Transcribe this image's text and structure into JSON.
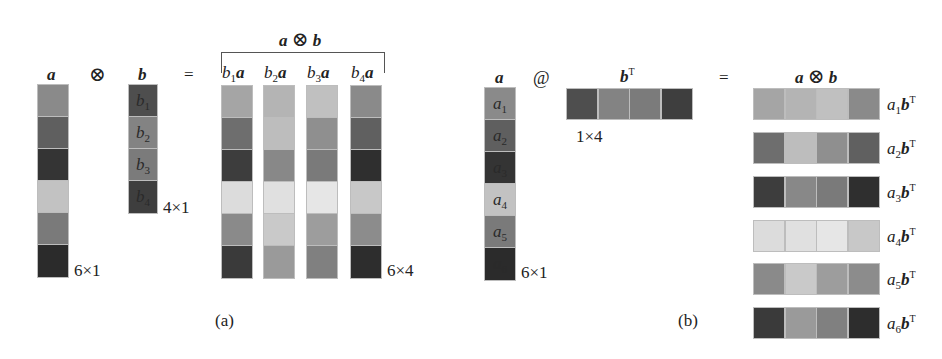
{
  "panel_a": {
    "caption": "(a)",
    "vector_a": {
      "label": "a",
      "shape": "6×1",
      "cells": [
        "#8a8a8a",
        "#5f5f5f",
        "#343434",
        "#c2c2c2",
        "#7a7a7a",
        "#2b2b2b"
      ]
    },
    "operator": "⊗",
    "vector_b": {
      "label": "b",
      "shape": "4×1",
      "cells": [
        {
          "color": "#4e4e4e",
          "text": "b",
          "sub": "1"
        },
        {
          "color": "#838383",
          "text": "b",
          "sub": "2"
        },
        {
          "color": "#7b7b7b",
          "text": "b",
          "sub": "3"
        },
        {
          "color": "#3e3e3e",
          "text": "b",
          "sub": "4"
        }
      ]
    },
    "equals": "=",
    "result": {
      "title_left": "a",
      "title_op": "⊗",
      "title_right": "b",
      "shape": "6×4",
      "columns": [
        {
          "label_b": "b",
          "sub": "1",
          "label_a": "a",
          "cells": [
            "#a5a5a5",
            "#6e6e6e",
            "#3d3d3d",
            "#dcdcdc",
            "#8a8a8a",
            "#3a3a3a"
          ]
        },
        {
          "label_b": "b",
          "sub": "2",
          "label_a": "a",
          "cells": [
            "#b4b4b4",
            "#bdbdbd",
            "#888888",
            "#e0e0e0",
            "#c9c9c9",
            "#9a9a9a"
          ]
        },
        {
          "label_b": "b",
          "sub": "3",
          "label_a": "a",
          "cells": [
            "#c0c0c0",
            "#8f8f8f",
            "#7a7a7a",
            "#e6e6e6",
            "#9d9d9d",
            "#808080"
          ]
        },
        {
          "label_b": "b",
          "sub": "4",
          "label_a": "a",
          "cells": [
            "#8a8a8a",
            "#606060",
            "#2f2f2f",
            "#c8c8c8",
            "#8c8c8c",
            "#2d2d2d"
          ]
        }
      ]
    }
  },
  "panel_b": {
    "caption": "(b)",
    "vector_a": {
      "label": "a",
      "shape": "6×1",
      "cells": [
        {
          "color": "#8a8a8a",
          "text": "a",
          "sub": "1"
        },
        {
          "color": "#5f5f5f",
          "text": "a",
          "sub": "2"
        },
        {
          "color": "#343434",
          "text": "a",
          "sub": "3"
        },
        {
          "color": "#c2c2c2",
          "text": "a",
          "sub": "4"
        },
        {
          "color": "#7a7a7a",
          "text": "a",
          "sub": "5"
        },
        {
          "color": "#2b2b2b",
          "text": "a",
          "sub": "6"
        }
      ]
    },
    "operator": "@",
    "vector_bT": {
      "label": "b",
      "sup": "T",
      "shape": "1×4",
      "cells": [
        "#4e4e4e",
        "#838383",
        "#7b7b7b",
        "#3e3e3e"
      ]
    },
    "equals": "=",
    "result": {
      "title_left": "a",
      "title_op": "⊗",
      "title_right": "b",
      "rows": [
        {
          "a": "a",
          "sub": "1",
          "b": "b",
          "sup": "T",
          "cells": [
            "#a5a5a5",
            "#b4b4b4",
            "#c0c0c0",
            "#8a8a8a"
          ]
        },
        {
          "a": "a",
          "sub": "2",
          "b": "b",
          "sup": "T",
          "cells": [
            "#6e6e6e",
            "#bdbdbd",
            "#8f8f8f",
            "#606060"
          ]
        },
        {
          "a": "a",
          "sub": "3",
          "b": "b",
          "sup": "T",
          "cells": [
            "#3d3d3d",
            "#888888",
            "#7a7a7a",
            "#2f2f2f"
          ]
        },
        {
          "a": "a",
          "sub": "4",
          "b": "b",
          "sup": "T",
          "cells": [
            "#dcdcdc",
            "#e0e0e0",
            "#e6e6e6",
            "#c8c8c8"
          ]
        },
        {
          "a": "a",
          "sub": "5",
          "b": "b",
          "sup": "T",
          "cells": [
            "#8a8a8a",
            "#c9c9c9",
            "#9d9d9d",
            "#8c8c8c"
          ]
        },
        {
          "a": "a",
          "sub": "6",
          "b": "b",
          "sup": "T",
          "cells": [
            "#3a3a3a",
            "#9a9a9a",
            "#808080",
            "#2d2d2d"
          ]
        }
      ]
    }
  }
}
